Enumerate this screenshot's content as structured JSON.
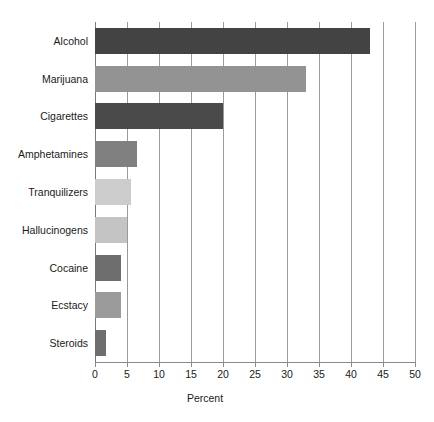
{
  "chart_data": {
    "type": "bar",
    "orientation": "horizontal",
    "title": "",
    "xlabel": "Percent",
    "ylabel": "",
    "xlim": [
      0,
      50
    ],
    "ylim": null,
    "grid": "vertical",
    "legend": "none",
    "xticks": [
      "0",
      "5",
      "10",
      "15",
      "20",
      "25",
      "30",
      "35",
      "40",
      "45",
      "50"
    ],
    "xtick_values": [
      0,
      5,
      10,
      15,
      20,
      25,
      30,
      35,
      40,
      45,
      50
    ],
    "categories": [
      "Alcohol",
      "Marijuana",
      "Cigarettes",
      "Amphetamines",
      "Tranquilizers",
      "Hallucinogens",
      "Cocaine",
      "Ecstacy",
      "Steroids"
    ],
    "values": [
      43,
      33,
      20,
      6.5,
      5.7,
      5,
      4,
      4,
      1.7
    ],
    "bar_colors": [
      "#434343",
      "#939393",
      "#4a4a4a",
      "#808080",
      "#cccccc",
      "#c4c4c4",
      "#6e6e6e",
      "#9b9b9b",
      "#6e6e6e"
    ],
    "bars": [
      {
        "category": "Alcohol",
        "value": 43,
        "color": "#434343"
      },
      {
        "category": "Marijuana",
        "value": 33,
        "color": "#939393"
      },
      {
        "category": "Cigarettes",
        "value": 20,
        "color": "#4a4a4a"
      },
      {
        "category": "Amphetamines",
        "value": 6.5,
        "color": "#808080"
      },
      {
        "category": "Tranquilizers",
        "value": 5.7,
        "color": "#cccccc"
      },
      {
        "category": "Hallucinogens",
        "value": 5,
        "color": "#c4c4c4"
      },
      {
        "category": "Cocaine",
        "value": 4,
        "color": "#6e6e6e"
      },
      {
        "category": "Ecstacy",
        "value": 4,
        "color": "#9b9b9b"
      },
      {
        "category": "Steroids",
        "value": 1.7,
        "color": "#6e6e6e"
      }
    ]
  },
  "style": {
    "background": "#ffffff",
    "gridline_color": "#9a9a9a",
    "axis_color": "#8a8a8a",
    "text_color": "#1a1a1a"
  }
}
